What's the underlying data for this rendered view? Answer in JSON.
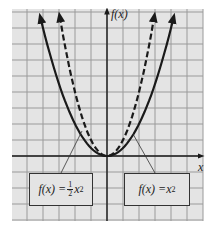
{
  "chart_data": {
    "type": "line",
    "title": "",
    "xlabel": "x",
    "ylabel": "f(x)",
    "grid": true,
    "xlim": [
      -6,
      6
    ],
    "ylim": [
      -4,
      9
    ],
    "series": [
      {
        "name": "f(x) = 1/2 x^2",
        "style": "solid",
        "expression": "0.5*x^2",
        "x": [
          -4.2,
          -4,
          -3,
          -2,
          -1,
          0,
          1,
          2,
          3,
          4,
          4.2
        ],
        "y": [
          8.82,
          8,
          4.5,
          2,
          0.5,
          0,
          0.5,
          2,
          4.5,
          8,
          8.82
        ]
      },
      {
        "name": "f(x) = x^2",
        "style": "dashed",
        "expression": "x^2",
        "x": [
          -3,
          -2,
          -1,
          0,
          1,
          2,
          3
        ],
        "y": [
          9,
          4,
          1,
          0,
          1,
          4,
          9
        ]
      }
    ],
    "annotations": [
      {
        "text": "f(x) = 1/2 x^2",
        "points_to": "left branch"
      },
      {
        "text": "f(x) = x^2",
        "points_to": "right branch"
      }
    ]
  },
  "axes": {
    "x_label": "x",
    "y_label": "f(x)"
  },
  "labels": {
    "left": {
      "prefix": "f(x) = ",
      "frac_num": "1",
      "frac_den": "2",
      "var": "x",
      "exp": "2"
    },
    "right": {
      "prefix": "f(x) = ",
      "var": "x",
      "exp": "2"
    }
  },
  "colors": {
    "grid_bg": "#e4e4e4",
    "grid_line": "#9a9a9a",
    "curve": "#1a1a1a",
    "axis": "#1a1a1a"
  }
}
